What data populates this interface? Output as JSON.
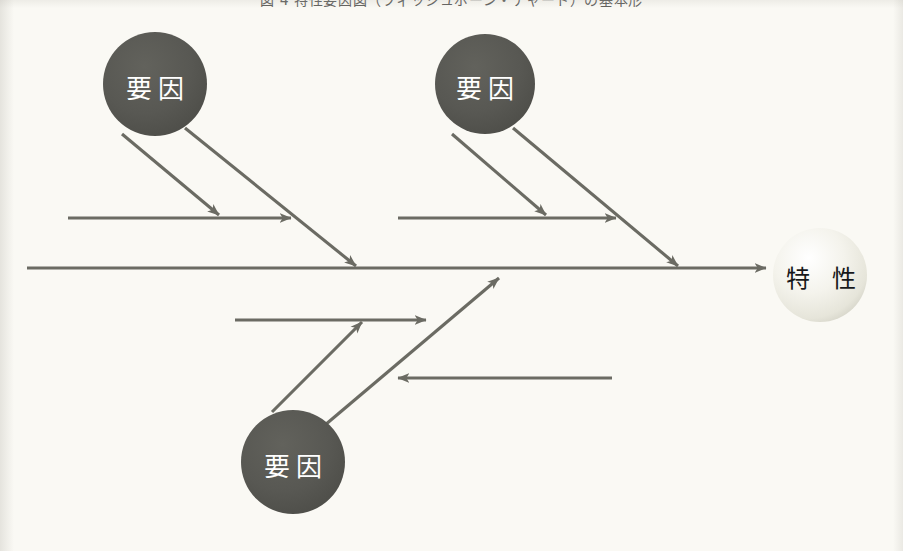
{
  "page": {
    "width": 903,
    "height": 551,
    "background_color": "#faf9f4",
    "caption": "図 4 特性要因図（フィッシュボーン・チャート）の基本形"
  },
  "palette": {
    "line_color": "#6b6b63",
    "cause_circle_fill": "#565651",
    "cause_text_color": "#ffffff",
    "effect_circle_fill": "#f2f1ea",
    "effect_text_color": "#17181a",
    "paper": "#faf9f4"
  },
  "diagram": {
    "type": "fishbone",
    "spine": {
      "label": "main-spine",
      "x1": 27,
      "y1": 268,
      "x2": 772,
      "y2": 268,
      "arrow": "right"
    },
    "effect_node": {
      "label": "特 性",
      "cx": 820,
      "cy": 275,
      "r": 47,
      "fill": "#f2f1ea",
      "text_color": "#17181a"
    },
    "cause_nodes": [
      {
        "id": "cause-upper-left",
        "label": "要因",
        "cx": 155,
        "cy": 84,
        "r": 52,
        "fill": "#565651"
      },
      {
        "id": "cause-upper-right",
        "label": "要因",
        "cx": 485,
        "cy": 84,
        "r": 50,
        "fill": "#565651"
      },
      {
        "id": "cause-lower-center",
        "label": "要因",
        "cx": 293,
        "cy": 462,
        "r": 52,
        "fill": "#565651"
      }
    ],
    "main_bones": [
      {
        "id": "bone-upper-left",
        "x1": 185,
        "y1": 128,
        "x2": 360,
        "y2": 270,
        "arrow": "end"
      },
      {
        "id": "bone-upper-right",
        "x1": 513,
        "y1": 128,
        "x2": 682,
        "y2": 270,
        "arrow": "end"
      },
      {
        "id": "bone-lower-center",
        "x1": 325,
        "y1": 425,
        "x2": 502,
        "y2": 275,
        "arrow": "end"
      }
    ],
    "sub_bones": [
      {
        "id": "sub-upper-left-horizontal",
        "x1": 68,
        "y1": 218,
        "x2": 297,
        "y2": 218,
        "arrow": "end",
        "direction": "right"
      },
      {
        "id": "sub-upper-left-diagonal",
        "x1": 122,
        "y1": 134,
        "x2": 224,
        "y2": 219,
        "arrow": "end",
        "direction": "down-right"
      },
      {
        "id": "sub-upper-right-horizontal",
        "x1": 398,
        "y1": 218,
        "x2": 622,
        "y2": 218,
        "arrow": "end",
        "direction": "right"
      },
      {
        "id": "sub-upper-right-diagonal",
        "x1": 452,
        "y1": 134,
        "x2": 551,
        "y2": 219,
        "arrow": "end",
        "direction": "down-right"
      },
      {
        "id": "sub-lower-horizontal-top",
        "x1": 235,
        "y1": 320,
        "x2": 432,
        "y2": 320,
        "arrow": "end",
        "direction": "right"
      },
      {
        "id": "sub-lower-diagonal",
        "x1": 272,
        "y1": 412,
        "x2": 366,
        "y2": 318,
        "arrow": "end",
        "direction": "up-right"
      },
      {
        "id": "sub-lower-horizontal-bottom",
        "x1": 612,
        "y1": 378,
        "x2": 392,
        "y2": 378,
        "arrow": "end",
        "direction": "left"
      }
    ]
  }
}
